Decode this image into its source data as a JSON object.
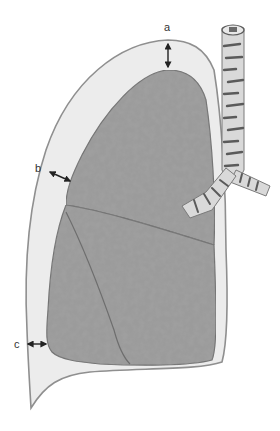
{
  "figure": {
    "labels": [
      {
        "id": "a",
        "text": "a",
        "x": 164,
        "y": 24
      },
      {
        "id": "b",
        "text": "b",
        "x": 36,
        "y": 166
      },
      {
        "id": "c",
        "text": "c",
        "x": 14,
        "y": 340
      }
    ],
    "colors": {
      "pleura_fill": "#ececec",
      "pleura_stroke": "#8f8f8f",
      "lung_fill": "#9a9a9a",
      "lung_stroke": "#6e6e6e",
      "trachea_fill": "#d9d9d9",
      "trachea_ring": "#5a5a5a",
      "arrow": "#222222"
    }
  }
}
